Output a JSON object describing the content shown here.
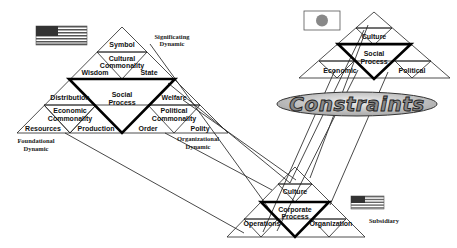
{
  "diagram": {
    "type": "pyramid-network",
    "constraints_label": "Constraints",
    "colors": {
      "line": "#222222",
      "ellipse_fill": "#c8c8c8",
      "text_fill": "#888888"
    },
    "parent_us_pyramid": {
      "flag": "US",
      "center_label": [
        "Social",
        "Process"
      ],
      "top": "Symbol",
      "cultural": [
        "Cultural",
        "Commonality"
      ],
      "wisdom": "Wisdom",
      "state": "State",
      "distribution": "Distribution",
      "economic": [
        "Economic",
        "Commonality"
      ],
      "resources": "Resources",
      "production": "Production",
      "welfare": "Welfare",
      "political": [
        "Political",
        "Commonality"
      ],
      "order": "Order",
      "polity": "Polity",
      "significating": [
        "Significating",
        "Dynamic"
      ],
      "foundational": [
        "Foundational",
        "Dynamic"
      ],
      "organizational": [
        "Organizational",
        "Dynamic"
      ]
    },
    "japan_pyramid": {
      "flag": "Japan",
      "top": "Culture",
      "center_label": [
        "Social",
        "Process"
      ],
      "left": "Economic",
      "right": "Political"
    },
    "subsidiary_pyramid": {
      "flag": "US",
      "top": "Culture",
      "center_label": [
        "Corporate",
        "Process"
      ],
      "left": "Operations",
      "right": "Organization",
      "caption": "Subsidiary"
    }
  }
}
